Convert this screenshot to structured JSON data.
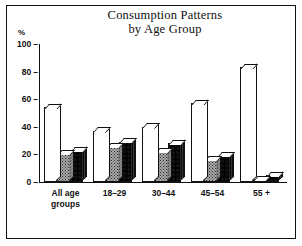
{
  "chart_data": {
    "type": "bar",
    "title": "Consumption Patterns by Age Group",
    "title_line1": "Consumption Patterns",
    "title_line2": "by Age Group",
    "xlabel": "",
    "ylabel": "%",
    "ylim": [
      0,
      100
    ],
    "yticks": [
      0,
      20,
      40,
      60,
      80,
      100
    ],
    "ytick_labels": [
      "0",
      "20",
      "40",
      "60",
      "80",
      "100"
    ],
    "grid": false,
    "legend": "none",
    "categories": [
      "All age groups",
      "18–29",
      "30–44",
      "45–54",
      "55 +"
    ],
    "series": [
      {
        "name": "series-1",
        "fill": "white",
        "values": [
          54,
          37,
          40,
          57,
          83
        ]
      },
      {
        "name": "series-2",
        "fill": "light-gray-dotted",
        "values": [
          21,
          26,
          22,
          16,
          2
        ]
      },
      {
        "name": "series-3",
        "fill": "dark-gray-dotted",
        "values": [
          23,
          29,
          28,
          19,
          5
        ]
      }
    ],
    "colors": {
      "series_1": "#ffffff",
      "series_2": "#a9a9a9",
      "series_3": "#4a4a4a",
      "axis": "#111111",
      "background": "#ffffff"
    }
  },
  "axis": {
    "percent_symbol": "%",
    "tick_dash": "–"
  },
  "xlabels": [
    {
      "line1": "All age",
      "line2": "groups"
    },
    {
      "line1": "18–29",
      "line2": ""
    },
    {
      "line1": "30–44",
      "line2": ""
    },
    {
      "line1": "45–54",
      "line2": ""
    },
    {
      "line1": "55 +",
      "line2": ""
    }
  ]
}
